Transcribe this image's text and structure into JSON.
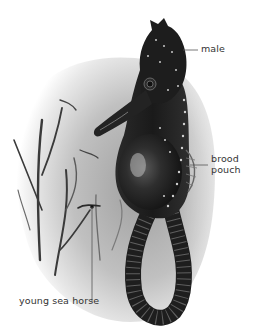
{
  "diagram": {
    "subject": "sea horse",
    "labels": {
      "male": "male",
      "brood_pouch": [
        "brood",
        "pouch"
      ],
      "young_sea_horse": "young sea horse"
    },
    "colors": {
      "background": "#ffffff",
      "water_gray": "#b9b9b9",
      "body_dark": "#1c1c1c",
      "highlight": "#d8d8d8",
      "label_text": "#333333",
      "leader_line": "#555555"
    }
  }
}
